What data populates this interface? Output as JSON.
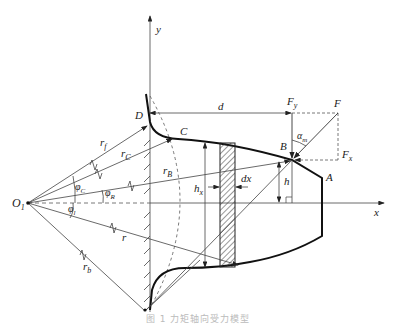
{
  "figure": {
    "type": "geometric force diagram",
    "axes": {
      "x_label": "x",
      "y_label": "y",
      "origin_label": "O",
      "origin_subscript": "1"
    },
    "points": [
      {
        "id": "A",
        "label": "A"
      },
      {
        "id": "B",
        "label": "B"
      },
      {
        "id": "C",
        "label": "C"
      },
      {
        "id": "D",
        "label": "D"
      }
    ],
    "radii": [
      {
        "base": "r",
        "sub": "f"
      },
      {
        "base": "r",
        "sub": "C"
      },
      {
        "base": "r",
        "sub": "B"
      },
      {
        "base": "r",
        "sub": ""
      },
      {
        "base": "r",
        "sub": "b"
      }
    ],
    "angles": [
      {
        "base": "φ",
        "sub": "C"
      },
      {
        "base": "φ",
        "sub": "R"
      },
      {
        "base": "φ",
        "sub": "l"
      }
    ],
    "dimensions": {
      "d": "d",
      "h": "h",
      "hx_base": "h",
      "hx_sub": "x",
      "dx": "dx"
    },
    "forces": {
      "F": "F",
      "Fy_base": "F",
      "Fy_sub": "y",
      "Fx_base": "F",
      "Fx_sub": "x",
      "alpha_base": "α",
      "alpha_sub": "m"
    },
    "colors": {
      "line": "#333333",
      "profile": "#111111",
      "dashed": "#555555"
    }
  },
  "caption": "图 1  力矩轴向受力模型"
}
